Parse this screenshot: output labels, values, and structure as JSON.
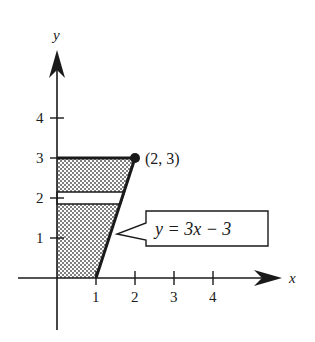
{
  "diagram": {
    "axes": {
      "x_label": "x",
      "y_label": "y",
      "x_ticks": [
        "1",
        "2",
        "3",
        "4"
      ],
      "y_ticks": [
        "1",
        "2",
        "3",
        "4"
      ]
    },
    "point": {
      "label": "(2, 3)",
      "x": 2,
      "y": 3
    },
    "callout": {
      "equation": "y = 3x − 3"
    },
    "region": {
      "description": "Shaded region between y-axis and line y = 3x − 3 for 0 ≤ y ≤ 3, with a horizontal unshaded strip near y = 2",
      "strip_y_range": [
        1.85,
        2.15
      ]
    },
    "colors": {
      "ink": "#1a1a1a",
      "shade": "#9a9a9a",
      "background": "#ffffff"
    }
  }
}
